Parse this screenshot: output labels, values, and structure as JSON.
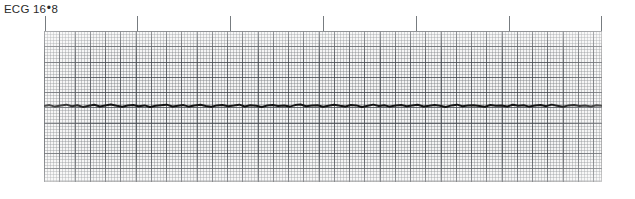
{
  "figure": {
    "caption_prefix": "ECG",
    "caption_separator": "•",
    "caption_number_major": "16",
    "caption_number_minor": "8",
    "caption_full": "ECG 16•8"
  },
  "colors": {
    "paper_background": "#f4f4f4",
    "grid_fine": "#787c80",
    "grid_major": "#484c52",
    "trace": "#141414",
    "tick_mark": "#777c80",
    "caption_text": "#2b2b2b",
    "page_background": "#ffffff"
  },
  "strip": {
    "left": 44,
    "top": 31,
    "width": 558,
    "height": 151,
    "fine_grid_spacing_px": 3.05,
    "major_grid_spacing_px": 15.25,
    "baseline_y_px": 75
  },
  "tick_ruler": {
    "height_px": 15,
    "positions_px": [
      1,
      93,
      186,
      279,
      372,
      465,
      557
    ]
  },
  "chart_data": {
    "type": "line",
    "title": "ECG 16•8",
    "xlabel": "",
    "ylabel": "",
    "grid": true,
    "legend": null,
    "rhythm": "flat baseline / asystole",
    "paper_speed_mm_per_s": 25,
    "gain_mm_per_mV": 10,
    "xlim": [
      0,
      11.2
    ],
    "ylim": [
      -1.0,
      1.0
    ],
    "x_unit": "seconds",
    "y_unit": "mV",
    "series": [
      {
        "name": "Lead II",
        "x": [
          0.0,
          0.11,
          0.22,
          0.34,
          0.45,
          0.56,
          0.67,
          0.78,
          0.9,
          1.01,
          1.12,
          1.23,
          1.34,
          1.46,
          1.57,
          1.68,
          1.79,
          1.9,
          2.02,
          2.13,
          2.24,
          2.35,
          2.46,
          2.58,
          2.69,
          2.8,
          2.91,
          3.02,
          3.14,
          3.25,
          3.36,
          3.47,
          3.58,
          3.7,
          3.81,
          3.92,
          4.03,
          4.14,
          4.26,
          4.37,
          4.48,
          4.59,
          4.7,
          4.82,
          4.93,
          5.04,
          5.15,
          5.26,
          5.38,
          5.49,
          5.6,
          5.71,
          5.82,
          5.94,
          6.05,
          6.16,
          6.27,
          6.38,
          6.5,
          6.61,
          6.72,
          6.83,
          6.94,
          7.06,
          7.17,
          7.28,
          7.39,
          7.5,
          7.62,
          7.73,
          7.84,
          7.95,
          8.06,
          8.18,
          8.29,
          8.4,
          8.51,
          8.62,
          8.74,
          8.85,
          8.96,
          9.07,
          9.18,
          9.3,
          9.41,
          9.52,
          9.63,
          9.74,
          9.86,
          9.97,
          10.08,
          10.19,
          10.3,
          10.42,
          10.53,
          10.64,
          10.75,
          10.86,
          10.98,
          11.09,
          11.2
        ],
        "y": [
          0.0,
          0.012,
          -0.008,
          0.006,
          0.018,
          -0.004,
          0.01,
          -0.012,
          0.004,
          0.016,
          -0.006,
          0.008,
          0.02,
          0.002,
          -0.01,
          0.006,
          0.014,
          -0.004,
          0.008,
          -0.014,
          0.002,
          0.01,
          0.018,
          -0.006,
          0.004,
          0.012,
          -0.008,
          0.006,
          0.016,
          0.0,
          -0.01,
          0.008,
          0.014,
          -0.002,
          0.006,
          0.018,
          -0.006,
          0.01,
          0.002,
          -0.012,
          0.006,
          0.014,
          0.0,
          0.008,
          -0.008,
          0.012,
          0.02,
          -0.004,
          0.006,
          0.01,
          -0.01,
          0.004,
          0.016,
          0.002,
          -0.006,
          0.012,
          0.008,
          -0.014,
          0.004,
          0.018,
          0.0,
          0.01,
          -0.008,
          0.006,
          0.014,
          -0.002,
          0.008,
          0.016,
          -0.006,
          0.002,
          0.012,
          0.004,
          -0.012,
          0.008,
          0.018,
          -0.004,
          0.006,
          0.01,
          0.0,
          -0.01,
          0.014,
          0.004,
          0.008,
          -0.006,
          0.016,
          0.002,
          0.01,
          -0.008,
          0.006,
          0.012,
          -0.002,
          0.018,
          0.004,
          -0.01,
          0.008,
          0.014,
          0.0,
          0.006,
          -0.006,
          0.01,
          0.002
        ]
      }
    ]
  }
}
